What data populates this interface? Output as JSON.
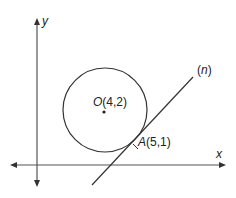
{
  "diagram": {
    "axes": {
      "x_label": "x",
      "y_label": "y"
    },
    "circle": {
      "center_label": "O(4,2)",
      "center_letter": "O",
      "center_coords": "(4,2)"
    },
    "tangent_point": {
      "label": "A(5,1)",
      "letter": "A",
      "coords": "(5,1)"
    },
    "line": {
      "label_open": "(",
      "label_name": "n",
      "label_close": ")"
    },
    "colors": {
      "stroke": "#333333",
      "axis": "#555555",
      "text": "#222222"
    }
  }
}
